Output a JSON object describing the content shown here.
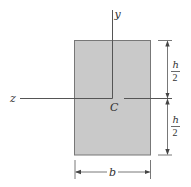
{
  "diagram": {
    "type": "rectangular cross-section with centroidal axes",
    "colors": {
      "section_fill": "#c9c9c9",
      "section_stroke": "#666666",
      "line": "#555555",
      "text": "#333333"
    },
    "axes": {
      "y_label": "y",
      "z_label": "z",
      "centroid_label": "C"
    },
    "dimensions": {
      "upper_height": {
        "numerator": "h",
        "denominator": "2"
      },
      "lower_height": {
        "numerator": "h",
        "denominator": "2"
      },
      "width": "b"
    }
  }
}
